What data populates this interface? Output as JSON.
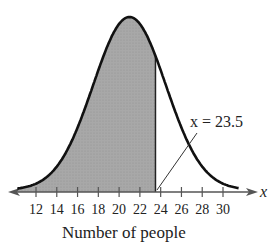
{
  "chart_data": {
    "type": "area",
    "title": "",
    "xlabel": "Number of people",
    "ylabel": "",
    "axis_variable": "x",
    "x_ticks": [
      12,
      14,
      16,
      18,
      20,
      22,
      24,
      26,
      28,
      30
    ],
    "xlim": [
      9,
      32
    ],
    "distribution": {
      "kind": "normal",
      "mean": 21,
      "sd": 3.5
    },
    "shaded_region": {
      "from": "-inf",
      "to": 23.5,
      "fill": "#a9a9a9"
    },
    "annotation": {
      "text": "x = 23.5",
      "x": 23.5
    },
    "grid": false,
    "legend": null
  },
  "labels": {
    "xlabel": "Number of people",
    "annotation": "x = 23.5",
    "axis_var": "x",
    "ticks": [
      "12",
      "14",
      "16",
      "18",
      "20",
      "22",
      "24",
      "26",
      "28",
      "30"
    ]
  }
}
